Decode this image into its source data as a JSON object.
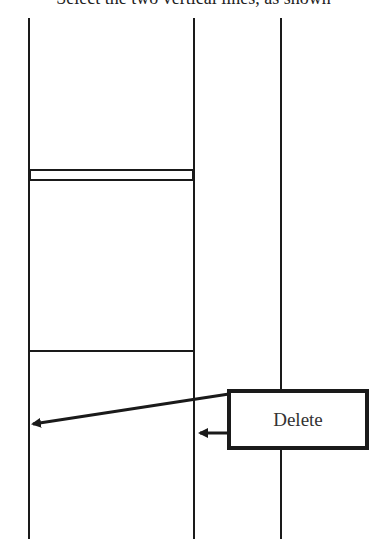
{
  "caption": "Select the two vertical lines, as shown",
  "callout": {
    "label": "Delete"
  },
  "colors": {
    "line": "#1a1a1a",
    "background": "#ffffff"
  }
}
